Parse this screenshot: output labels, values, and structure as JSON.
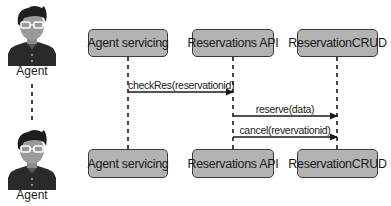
{
  "diagram": {
    "type": "sequence",
    "actors": [
      {
        "id": "agent",
        "label": "Agent",
        "icon": "person-avatar-icon"
      }
    ],
    "participants": [
      {
        "id": "agent_servicing",
        "label": "Agent servicing"
      },
      {
        "id": "reservations_api",
        "label": "Reservations API"
      },
      {
        "id": "reservation_crud",
        "label": "ReservationCRUD"
      }
    ],
    "messages": [
      {
        "from": "agent_servicing",
        "to": "reservations_api",
        "label": "checkRes(reservationid)"
      },
      {
        "from": "reservations_api",
        "to": "reservation_crud",
        "label": "reserve(data)"
      },
      {
        "from": "reservations_api",
        "to": "reservation_crud",
        "label": "cancel(revervationid)"
      }
    ],
    "colors": {
      "box_fill": "#b3b3b3",
      "box_border": "#3a3a3a",
      "line": "#1a1a1a",
      "text": "#1a1a1a"
    }
  }
}
